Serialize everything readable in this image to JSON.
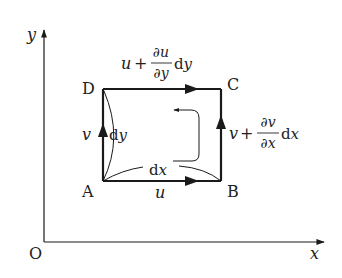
{
  "axes": {
    "x_label": "x",
    "y_label": "y",
    "origin_label": "O"
  },
  "corners": {
    "A": "A",
    "B": "B",
    "C": "C",
    "D": "D"
  },
  "edges": {
    "bottom": {
      "velocity": "u",
      "length": "dx"
    },
    "left": {
      "velocity": "v",
      "length": "dy"
    },
    "top": {
      "base": "u",
      "plus": "+",
      "num": "∂u",
      "den": "∂y",
      "tail": "dy"
    },
    "right": {
      "base": "v",
      "plus": "+",
      "num": "∂v",
      "den": "∂x",
      "tail": "dx"
    }
  },
  "colors": {
    "line": "#1a1a1a",
    "text": "#222222",
    "background": "#ffffff"
  }
}
